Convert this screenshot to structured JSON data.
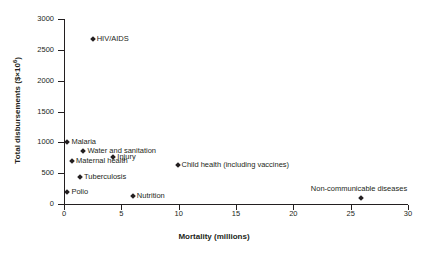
{
  "chart_data": {
    "type": "scatter",
    "title": "",
    "xlabel": "Mortality (millions)",
    "ylabel": "Total disbursements ($×10⁶)",
    "ylabel_prefix": "Total disbursements ($×10",
    "ylabel_exponent": "6",
    "ylabel_suffix": ")",
    "xlim": [
      0,
      30
    ],
    "ylim": [
      0,
      3000
    ],
    "xticks": [
      0,
      5,
      10,
      15,
      20,
      25,
      30
    ],
    "yticks": [
      0,
      500,
      1000,
      1500,
      2000,
      2500,
      3000
    ],
    "xtick_labels": [
      "0",
      "5",
      "10",
      "15",
      "20",
      "25",
      "30"
    ],
    "ytick_labels": [
      "0",
      "500",
      "1000",
      "1500",
      "2000",
      "2500",
      "3000"
    ],
    "grid": false,
    "legend": "none",
    "marker": "diamond",
    "marker_color": "#231f20",
    "points": [
      {
        "label": "HIV/AIDS",
        "x": 2.5,
        "y": 2680,
        "label_pos": "right"
      },
      {
        "label": "Malaria",
        "x": 0.3,
        "y": 1000,
        "label_pos": "right"
      },
      {
        "label": "Water and sanitation",
        "x": 1.7,
        "y": 860,
        "label_pos": "right"
      },
      {
        "label": "Injury",
        "x": 4.3,
        "y": 760,
        "label_pos": "right"
      },
      {
        "label": "Child health (including vaccines)",
        "x": 9.9,
        "y": 640,
        "label_pos": "right"
      },
      {
        "label": "Maternal health",
        "x": 0.7,
        "y": 690,
        "label_pos": "right"
      },
      {
        "label": "Tuberculosis",
        "x": 1.4,
        "y": 440,
        "label_pos": "right"
      },
      {
        "label": "Polio",
        "x": 0.3,
        "y": 190,
        "label_pos": "right"
      },
      {
        "label": "Nutrition",
        "x": 6.0,
        "y": 130,
        "label_pos": "right"
      },
      {
        "label": "Non-communicable diseases",
        "x": 25.9,
        "y": 90,
        "label_pos": "above"
      }
    ]
  }
}
